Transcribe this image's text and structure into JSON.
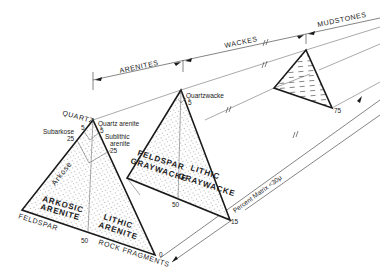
{
  "diagram": {
    "categories": {
      "arenites": "ARENITES",
      "wackes": "WACKES",
      "mudstones": "MUDSTONES"
    },
    "axis": {
      "label": "Percent Matrix <30μ",
      "ticks": [
        "0",
        "15",
        "75"
      ]
    },
    "triangle_arenite": {
      "apex": "QUARTZ",
      "left": "FELDSPAR",
      "right": "ROCK FRAGMENTS",
      "fields": {
        "quartz_arenite": "Quartz arenite",
        "subarkose": "Subarkose",
        "sublithic_arenite": "Sublithic arenite",
        "sublithic_1": "Sublithic",
        "sublithic_2": "arenite",
        "arkose": "Arkose",
        "arkosic_arenite_1": "ARKOSIC",
        "arkosic_arenite_2": "ARENITE",
        "lithic_arenite_1": "LITHIC",
        "lithic_arenite_2": "ARENITE"
      },
      "ticks": {
        "apex_left_5": "5",
        "apex_right_5": "5",
        "left_25": "25",
        "right_25": "25",
        "base_50": "50"
      }
    },
    "triangle_wacke": {
      "fields": {
        "quartzwacke": "Quartzwacke",
        "feldspar_graywacke_1": "FELDSPAR",
        "feldspar_graywacke_2": "GRAYWACKE",
        "lithic_graywacke_1": "LITHIC",
        "lithic_graywacke_2": "GRAYWACKE"
      },
      "ticks": {
        "apex_5": "5",
        "base_50": "50"
      }
    },
    "triangle_mudstone": {
      "pattern": "dashed"
    }
  }
}
